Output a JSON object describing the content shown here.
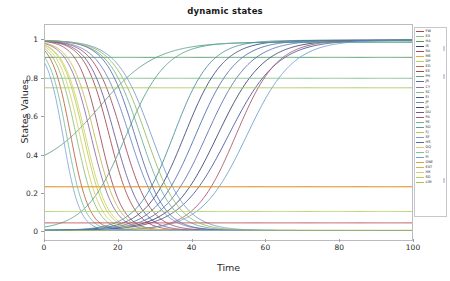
{
  "chart_data": {
    "type": "line",
    "title": "dynamic states",
    "xlabel": "Time",
    "ylabel": "States Values",
    "xlim": [
      0,
      100
    ],
    "ylim": [
      -0.05,
      1.08
    ],
    "xticks": [
      0,
      20,
      40,
      60,
      80,
      100
    ],
    "yticks": [
      0,
      0.2,
      0.4,
      0.6,
      0.8,
      1
    ],
    "xtick_labels": [
      "0",
      "20",
      "40",
      "60",
      "80",
      "100"
    ],
    "ytick_labels": [
      "0",
      "0.2",
      "0.4",
      "0.6",
      "0.8",
      "1"
    ],
    "grid": false,
    "legend_position": "right-outside",
    "x": [
      0,
      2,
      4,
      6,
      8,
      10,
      12,
      14,
      16,
      18,
      20,
      22,
      24,
      26,
      28,
      30,
      32,
      34,
      36,
      38,
      40,
      42,
      44,
      46,
      48,
      50,
      52,
      54,
      56,
      58,
      60,
      62,
      64,
      66,
      68,
      70,
      72,
      74,
      76,
      78,
      80,
      84,
      88,
      92,
      96,
      100
    ],
    "series": [
      {
        "name": "FW",
        "color": "#a84a4a",
        "kind": "decay",
        "start": 1.0,
        "end": 0.0,
        "midpoint": 17.5,
        "rate": 0.3
      },
      {
        "name": "EX",
        "color": "#8fbf7f",
        "kind": "decay",
        "start": 1.0,
        "end": 0.0,
        "midpoint": 8.5,
        "rate": 0.36
      },
      {
        "name": "HA",
        "color": "#4f9a5e",
        "kind": "constant",
        "value": 0.91
      },
      {
        "name": "IS",
        "color": "#36406e",
        "kind": "rise",
        "start": 0.0,
        "end": 1.0,
        "midpoint": 47.0,
        "rate": 0.16
      },
      {
        "name": "RA",
        "color": "#9d4d62",
        "kind": "decay",
        "start": 1.0,
        "end": 0.0,
        "midpoint": 15.0,
        "rate": 0.33
      },
      {
        "name": "ME",
        "color": "#e8a33d",
        "kind": "constant",
        "value": 0.23
      },
      {
        "name": "DP",
        "color": "#b6cf63",
        "kind": "decay",
        "start": 1.0,
        "end": 0.0,
        "midpoint": 10.5,
        "rate": 0.34
      },
      {
        "name": "ED",
        "color": "#c0663c",
        "kind": "decay",
        "start": 1.0,
        "end": 0.0,
        "midpoint": 7.0,
        "rate": 0.4
      },
      {
        "name": "EE",
        "color": "#a4485c",
        "kind": "decay",
        "start": 1.0,
        "end": 0.0,
        "midpoint": 21.0,
        "rate": 0.26
      },
      {
        "name": "PH",
        "color": "#5f9e86",
        "kind": "peak",
        "peak_x": 33.0,
        "peak_y": 0.99,
        "start": 0.31,
        "rate": 0.13
      },
      {
        "name": "JR",
        "color": "#5a6fae",
        "kind": "rise",
        "start": 0.0,
        "end": 1.0,
        "midpoint": 44.0,
        "rate": 0.17
      },
      {
        "name": "CY",
        "color": "#8e6fa8",
        "kind": "decay",
        "start": 1.0,
        "end": 0.0,
        "midpoint": 12.5,
        "rate": 0.32
      },
      {
        "name": "SC",
        "color": "#7fbb8e",
        "kind": "constant",
        "value": 0.8
      },
      {
        "name": "EI",
        "color": "#45569a",
        "kind": "rise",
        "start": 0.0,
        "end": 1.0,
        "midpoint": 50.0,
        "rate": 0.15
      },
      {
        "name": "JP",
        "color": "#6d85c4",
        "kind": "decay",
        "start": 1.0,
        "end": 0.0,
        "midpoint": 23.0,
        "rate": 0.24
      },
      {
        "name": "JA",
        "color": "#3c4a7a",
        "kind": "rise",
        "start": 0.0,
        "end": 1.0,
        "midpoint": 38.0,
        "rate": 0.19
      },
      {
        "name": "DU",
        "color": "#6d5a9c",
        "kind": "decay",
        "start": 1.0,
        "end": 0.0,
        "midpoint": 19.0,
        "rate": 0.28
      },
      {
        "name": "PA",
        "color": "#a6566e",
        "kind": "rise",
        "start": 0.0,
        "end": 1.0,
        "midpoint": 52.0,
        "rate": 0.18
      },
      {
        "name": "PE",
        "color": "#72ad9a",
        "kind": "decay",
        "start": 1.0,
        "end": 0.0,
        "midpoint": 26.0,
        "rate": 0.23
      },
      {
        "name": "SO",
        "color": "#57a38d",
        "kind": "rise",
        "start": 0.0,
        "end": 0.99,
        "midpoint": 22.0,
        "rate": 0.18
      },
      {
        "name": "FJ",
        "color": "#a9c858",
        "kind": "constant",
        "value": 0.75
      },
      {
        "name": "SF",
        "color": "#7a9bc9",
        "kind": "decay",
        "start": 1.0,
        "end": 0.0,
        "midpoint": 29.0,
        "rate": 0.21
      },
      {
        "name": "HS",
        "color": "#4a6fa8",
        "kind": "rise",
        "start": 0.0,
        "end": 1.0,
        "midpoint": 41.0,
        "rate": 0.18
      },
      {
        "name": "DQ",
        "color": "#d8cf6a",
        "kind": "decay",
        "start": 1.0,
        "end": 0.0,
        "midpoint": 9.5,
        "rate": 0.35
      },
      {
        "name": "CI",
        "color": "#7bbfae",
        "kind": "decay",
        "start": 0.98,
        "end": 0.0,
        "midpoint": 6.0,
        "rate": 0.42
      },
      {
        "name": "PI",
        "color": "#6f9fd0",
        "kind": "rise",
        "start": 0.0,
        "end": 1.0,
        "midpoint": 55.0,
        "rate": 0.16
      },
      {
        "name": "ONE",
        "color": "#e0a13c",
        "kind": "constant",
        "value": 0.23
      },
      {
        "name": "EXT",
        "color": "#c8b857",
        "kind": "decay",
        "start": 1.0,
        "end": 0.0,
        "midpoint": 13.5,
        "rate": 0.31
      },
      {
        "name": "HK",
        "color": "#d6d05e",
        "kind": "decay",
        "start": 1.0,
        "end": 0.0,
        "midpoint": 11.0,
        "rate": 0.33
      },
      {
        "name": "SD",
        "color": "#b5ce5e",
        "kind": "constant",
        "value": 0.1
      },
      {
        "name": "LIM",
        "color": "#9fc25a",
        "kind": "constant",
        "value": 0.0
      },
      {
        "name": "S1",
        "color": "#b94a55",
        "kind": "constant",
        "value": 0.04
      },
      {
        "name": "S2",
        "color": "#5d6ea8",
        "kind": "decay",
        "start": 1.0,
        "end": 0.0,
        "midpoint": 24.5,
        "rate": 0.25
      },
      {
        "name": "S3",
        "color": "#88a8d4",
        "kind": "decay",
        "start": 0.97,
        "end": 0.0,
        "midpoint": 5.0,
        "rate": 0.45
      },
      {
        "name": "S4",
        "color": "#4e8d9c",
        "kind": "rise",
        "start": 0.0,
        "end": 1.0,
        "midpoint": 35.0,
        "rate": 0.2
      },
      {
        "name": "S5",
        "color": "#9ab85c",
        "kind": "decay",
        "start": 1.0,
        "end": 0.0,
        "midpoint": 27.5,
        "rate": 0.22
      }
    ],
    "legend_entries": [
      {
        "label": "FW",
        "color": "#a84a4a"
      },
      {
        "label": "EX",
        "color": "#8fbf7f"
      },
      {
        "label": "HA",
        "color": "#4f9a5e"
      },
      {
        "label": "IS",
        "color": "#36406e"
      },
      {
        "label": "RA",
        "color": "#9d4d62"
      },
      {
        "label": "ME",
        "color": "#e8a33d"
      },
      {
        "label": "DP",
        "color": "#b6cf63"
      },
      {
        "label": "ED",
        "color": "#c0663c"
      },
      {
        "label": "EE",
        "color": "#a4485c"
      },
      {
        "label": "PH",
        "color": "#5f9e86"
      },
      {
        "label": "JR",
        "color": "#5a6fae"
      },
      {
        "label": "CY",
        "color": "#8e6fa8"
      },
      {
        "label": "SC",
        "color": "#7fbb8e"
      },
      {
        "label": "EI",
        "color": "#45569a"
      },
      {
        "label": "JP",
        "color": "#6d85c4"
      },
      {
        "label": "JA",
        "color": "#3c4a7a"
      },
      {
        "label": "DU",
        "color": "#6d5a9c"
      },
      {
        "label": "PA",
        "color": "#a6566e"
      },
      {
        "label": "PE",
        "color": "#72ad9a"
      },
      {
        "label": "SO",
        "color": "#57a38d"
      },
      {
        "label": "FJ",
        "color": "#a9c858"
      },
      {
        "label": "SF",
        "color": "#7a9bc9"
      },
      {
        "label": "HS",
        "color": "#4a6fa8"
      },
      {
        "label": "DQ",
        "color": "#d8cf6a"
      },
      {
        "label": "CI",
        "color": "#7bbfae"
      },
      {
        "label": "PI",
        "color": "#6f9fd0"
      },
      {
        "label": "ONE",
        "color": "#e0a13c"
      },
      {
        "label": "EXT",
        "color": "#c8b857"
      },
      {
        "label": "HK",
        "color": "#d6d05e"
      },
      {
        "label": "SD",
        "color": "#b5ce5e"
      },
      {
        "label": "LIM",
        "color": "#9fc25a"
      }
    ]
  }
}
